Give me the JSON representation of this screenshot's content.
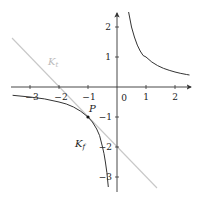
{
  "diagram": {
    "type": "function-plot",
    "axes": {
      "x_ticks": [
        {
          "value": -3,
          "label": "−3"
        },
        {
          "value": -2,
          "label": "−2"
        },
        {
          "value": -1,
          "label": "−1"
        },
        {
          "value": 0,
          "label": "0"
        },
        {
          "value": 1,
          "label": "1"
        },
        {
          "value": 2,
          "label": "2"
        }
      ],
      "y_ticks": [
        {
          "value": 2,
          "label": "2"
        },
        {
          "value": 1,
          "label": "1"
        },
        {
          "value": -1,
          "label": "−1"
        },
        {
          "value": -2,
          "label": "−2"
        },
        {
          "value": -3,
          "label": "−3"
        }
      ],
      "x_range": [
        -3.6,
        2.5
      ],
      "y_range": [
        -3.4,
        2.4
      ],
      "color": "#333333"
    },
    "curves": {
      "graph": {
        "label_main": "K",
        "label_sub": "f",
        "function": "f(x) = 1/x",
        "color": "#333333"
      },
      "tangent": {
        "label_main": "K",
        "label_sub": "t",
        "function": "t(x) = -x - 2",
        "color": "#c8c8c8"
      }
    },
    "point": {
      "label": "P",
      "x": -1,
      "y": -1
    }
  }
}
